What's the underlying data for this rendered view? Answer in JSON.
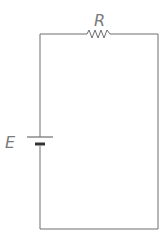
{
  "diagram": {
    "type": "circuit",
    "components": [
      {
        "id": "R",
        "kind": "resistor",
        "label": "R",
        "position": "top wire"
      },
      {
        "id": "E",
        "kind": "battery",
        "label": "E",
        "position": "left wire"
      }
    ],
    "wire_color": "#6e6e6e",
    "label_color": "#7a7a7a"
  }
}
